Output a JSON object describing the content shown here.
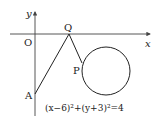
{
  "diagram": {
    "axes": {
      "x_label": "x",
      "y_label": "y",
      "origin_label": "O"
    },
    "points": {
      "A": "A",
      "Q": "Q",
      "P": "P"
    },
    "equation": "(x−6)²+(y+3)²=4",
    "colors": {
      "line": "#222222",
      "axis": "#444444",
      "background": "#ffffff"
    }
  }
}
